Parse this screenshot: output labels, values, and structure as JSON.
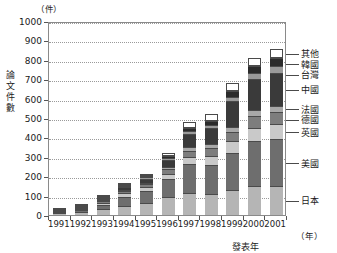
{
  "chart_data": {
    "type": "bar",
    "stacked": true,
    "title": "",
    "xlabel": "發表年",
    "ylabel": "論文件數",
    "x_unit": "（年）",
    "y_unit": "（件）",
    "ylim": [
      0,
      1000
    ],
    "ytick_step": 100,
    "yticks": [
      "0",
      "100",
      "200",
      "300",
      "400",
      "500",
      "600",
      "700",
      "800",
      "900",
      "1000"
    ],
    "grid": true,
    "legend_position": "right",
    "categories": [
      "1991",
      "1992",
      "1993",
      "1994",
      "1995",
      "1996",
      "1997",
      "1998",
      "1999",
      "2000",
      "2001"
    ],
    "series": [
      {
        "name": "日本",
        "color": "#b5b5b5",
        "values": [
          8,
          16,
          30,
          44,
          62,
          92,
          112,
          110,
          130,
          150,
          150
        ]
      },
      {
        "name": "美國",
        "color": "#6e6e6e",
        "values": [
          4,
          9,
          22,
          50,
          60,
          96,
          150,
          150,
          190,
          230,
          240
        ]
      },
      {
        "name": "英國",
        "color": "#c9c9c9",
        "values": [
          1,
          3,
          10,
          18,
          20,
          26,
          36,
          46,
          60,
          70,
          80
        ]
      },
      {
        "name": "德國",
        "color": "#7d7d7d",
        "values": [
          1,
          2,
          8,
          12,
          16,
          22,
          34,
          40,
          50,
          60,
          60
        ]
      },
      {
        "name": "法國",
        "color": "#a8a8a8",
        "values": [
          0,
          1,
          4,
          6,
          8,
          14,
          18,
          22,
          26,
          30,
          34
        ]
      },
      {
        "name": "中國",
        "color": "#3a3a3a",
        "values": [
          0,
          1,
          6,
          14,
          22,
          36,
          70,
          80,
          130,
          160,
          170
        ]
      },
      {
        "name": "台灣",
        "color": "#9a9a9a",
        "values": [
          0,
          0,
          2,
          4,
          6,
          10,
          14,
          18,
          24,
          30,
          34
        ]
      },
      {
        "name": "韓國",
        "color": "#2b2b2b",
        "values": [
          0,
          0,
          2,
          4,
          6,
          10,
          16,
          20,
          30,
          36,
          42
        ]
      },
      {
        "name": "其他",
        "color": "#ffffff",
        "values": [
          1,
          1,
          6,
          8,
          10,
          14,
          30,
          34,
          40,
          44,
          45
        ]
      }
    ],
    "totals": [
      15,
      33,
      90,
      160,
      210,
      320,
      480,
      520,
      680,
      810,
      855
    ],
    "legend_entries": [
      "其他",
      "韓國",
      "台灣",
      "中國",
      "法國",
      "德國",
      "英國",
      "美國",
      "日本"
    ]
  }
}
